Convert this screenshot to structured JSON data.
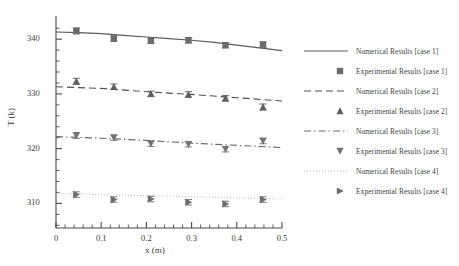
{
  "chart_data": {
    "type": "line",
    "title": "",
    "xlabel": "x (m)",
    "ylabel": "T (k)",
    "xlim": [
      0,
      0.5
    ],
    "ylim": [
      305.5,
      343.5
    ],
    "xticks": [
      0,
      0.1,
      0.2,
      0.3,
      0.4,
      0.5
    ],
    "xticklabels": [
      "0",
      "0.1",
      "0.2",
      "0.3",
      "0.4",
      "0.5"
    ],
    "yticks": [
      310,
      320,
      330,
      340
    ],
    "yticklabels": [
      "310",
      "320",
      "330",
      "340"
    ],
    "x_minor_tick_step": 0.02,
    "y_minor_tick_step": 2,
    "grid": false,
    "legend_position": "right",
    "x": [
      0.045,
      0.128,
      0.21,
      0.293,
      0.375,
      0.458
    ],
    "series": [
      {
        "name": "Numerical Results [case 1]",
        "kind": "numerical",
        "case": 1,
        "linestyle": "solid",
        "color": "#5a5a5a",
        "curve": [
          {
            "x": 0.0,
            "y": 341.3
          },
          {
            "x": 0.05,
            "y": 341.2
          },
          {
            "x": 0.1,
            "y": 341.0
          },
          {
            "x": 0.15,
            "y": 340.7
          },
          {
            "x": 0.2,
            "y": 340.4
          },
          {
            "x": 0.25,
            "y": 340.1
          },
          {
            "x": 0.3,
            "y": 339.8
          },
          {
            "x": 0.35,
            "y": 339.4
          },
          {
            "x": 0.4,
            "y": 338.9
          },
          {
            "x": 0.45,
            "y": 338.4
          },
          {
            "x": 0.5,
            "y": 337.9
          }
        ]
      },
      {
        "name": "Experimental Results [case 1]",
        "kind": "experimental",
        "case": 1,
        "marker": "square",
        "color": "#6b6b6b",
        "values": [
          341.5,
          340.1,
          339.7,
          339.8,
          338.9,
          339.0
        ],
        "yerr": [
          0.55,
          0.5,
          0.5,
          0.5,
          0.5,
          0.5
        ]
      },
      {
        "name": "Numerical Results [case 2]",
        "kind": "numerical",
        "case": 2,
        "linestyle": "dashed",
        "color": "#4f4f4f",
        "curve": [
          {
            "x": 0.0,
            "y": 331.3
          },
          {
            "x": 0.1,
            "y": 331.0
          },
          {
            "x": 0.2,
            "y": 330.4
          },
          {
            "x": 0.3,
            "y": 329.9
          },
          {
            "x": 0.4,
            "y": 329.3
          },
          {
            "x": 0.5,
            "y": 328.7
          }
        ]
      },
      {
        "name": "Experimental Results [case 2]",
        "kind": "experimental",
        "case": 2,
        "marker": "triangle-up",
        "color": "#5f5f5f",
        "values": [
          332.3,
          331.3,
          330.0,
          329.9,
          329.2,
          327.6
        ],
        "yerr": [
          0.55,
          0.5,
          0.5,
          0.5,
          0.5,
          0.55
        ]
      },
      {
        "name": "Numerical Results [case 3]",
        "kind": "numerical",
        "case": 3,
        "linestyle": "dashdot",
        "color": "#6a6a6a",
        "curve": [
          {
            "x": 0.0,
            "y": 322.2
          },
          {
            "x": 0.1,
            "y": 321.9
          },
          {
            "x": 0.2,
            "y": 321.5
          },
          {
            "x": 0.3,
            "y": 321.0
          },
          {
            "x": 0.4,
            "y": 320.6
          },
          {
            "x": 0.5,
            "y": 320.2
          }
        ]
      },
      {
        "name": "Experimental Results [case 3]",
        "kind": "experimental",
        "case": 3,
        "marker": "triangle-down",
        "color": "#737373",
        "values": [
          322.4,
          322.0,
          320.9,
          320.8,
          319.9,
          321.4
        ],
        "yerr": [
          0.55,
          0.5,
          0.5,
          0.5,
          0.5,
          0.5
        ]
      },
      {
        "name": "Numerical Results [case 4]",
        "kind": "numerical",
        "case": 4,
        "linestyle": "dotted",
        "color": "#9a9a9a",
        "curve": [
          {
            "x": 0.0,
            "y": 311.8
          },
          {
            "x": 0.1,
            "y": 311.6
          },
          {
            "x": 0.2,
            "y": 311.4
          },
          {
            "x": 0.3,
            "y": 311.2
          },
          {
            "x": 0.4,
            "y": 311.0
          },
          {
            "x": 0.5,
            "y": 310.8
          }
        ]
      },
      {
        "name": "Experimental Results [case 4]",
        "kind": "experimental",
        "case": 4,
        "marker": "triangle-right",
        "color": "#6d6d6d",
        "values": [
          311.6,
          310.7,
          310.8,
          310.2,
          309.9,
          310.7
        ],
        "yerr": [
          0.5,
          0.5,
          0.5,
          0.5,
          0.5,
          0.5
        ]
      }
    ]
  },
  "legend": {
    "items": [
      {
        "label": "Numerical Results [case 1]",
        "key": "line-solid"
      },
      {
        "label": "Experimental Results [case 1]",
        "key": "marker-square"
      },
      {
        "label": "Numerical Results [case 2]",
        "key": "line-dashed"
      },
      {
        "label": "Experimental Results [case 2]",
        "key": "marker-triangle-up"
      },
      {
        "label": "Numerical Results [case 3]",
        "key": "line-dashdot"
      },
      {
        "label": "Experimental Results [case 3]",
        "key": "marker-triangle-down"
      },
      {
        "label": "Numerical Results [case 4]",
        "key": "line-dotted"
      },
      {
        "label": "Experimental Results [case 4]",
        "key": "marker-triangle-right"
      }
    ]
  }
}
